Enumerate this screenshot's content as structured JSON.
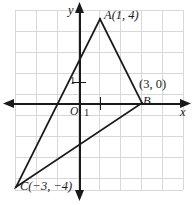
{
  "figure": {
    "colors": {
      "grid": "#d6d6d6",
      "grid_major": "#bdbdbd",
      "axis": "#1a1a1a",
      "shape": "#1a1a1a",
      "background": "#ffffff"
    },
    "grid": {
      "left": 15,
      "top": 10,
      "right": 183,
      "bottom": 190,
      "cell": 21,
      "cols": 8,
      "rows": 8.6
    },
    "axes": {
      "origin_px": {
        "x": 79,
        "y": 103
      },
      "unit_px": 21,
      "x_label": "x",
      "y_label": "y",
      "origin_label": "O",
      "x_tick_label": "1",
      "y_tick_label": "1",
      "x_range": [
        -3.4,
        5.0
      ],
      "y_range": [
        -4.6,
        4.7
      ]
    },
    "shape": {
      "type": "triangle",
      "name": "ABC",
      "vertices": [
        {
          "name": "A",
          "label": "A",
          "coords": "(1, 4)",
          "x": 1,
          "y": 4
        },
        {
          "name": "B",
          "label": "B",
          "coords": "(3, 0)",
          "x": 3,
          "y": 0
        },
        {
          "name": "C",
          "label": "C",
          "coords": "(−3, −4)",
          "x": -3,
          "y": -4
        }
      ],
      "labels": {
        "A_full": "A(1, 4)",
        "B_point": "B",
        "B_coords": "(3, 0)",
        "C_full": "C(−3, −4)"
      }
    }
  }
}
